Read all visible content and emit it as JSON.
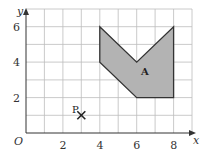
{
  "diagram": {
    "axes": {
      "x_label": "x",
      "y_label": "y",
      "origin_label": "O",
      "x_ticks": [
        "2",
        "4",
        "6",
        "8"
      ],
      "y_ticks": [
        "2",
        "4",
        "6"
      ],
      "x_range": [
        0,
        9
      ],
      "y_range": [
        0,
        7
      ],
      "grid": true
    },
    "shape_A": {
      "label": "A",
      "vertices": [
        [
          4,
          6
        ],
        [
          6,
          4
        ],
        [
          8,
          6
        ],
        [
          8,
          2
        ],
        [
          6,
          2
        ],
        [
          4,
          4
        ]
      ],
      "fill": "#b3b3b3",
      "stroke": "#333333"
    },
    "point_P": {
      "label": "P",
      "x": 3,
      "y": 1,
      "marker": "cross"
    }
  }
}
